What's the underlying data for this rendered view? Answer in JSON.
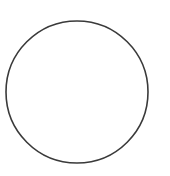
{
  "canvas": {
    "width": 170,
    "height": 176,
    "background_color": "#ffffff"
  },
  "shapes": [
    {
      "name": "circle-outline",
      "type": "circle",
      "center_x": 77,
      "center_y": 92,
      "radius_x": 71,
      "radius_y": 71,
      "stroke_color": "#3a3a3a",
      "stroke_width": 1.6,
      "fill": "none"
    }
  ],
  "text": []
}
